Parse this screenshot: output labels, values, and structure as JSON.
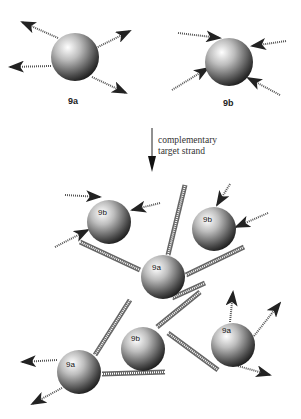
{
  "figure": {
    "top_particles": [
      {
        "id": "9a",
        "label": "9a",
        "cx": 75,
        "cy": 57,
        "r": 24
      },
      {
        "id": "9b",
        "label": "9b",
        "cx": 229,
        "cy": 62,
        "r": 24
      }
    ],
    "reaction_arrow": {
      "caption_line1": "complementary",
      "caption_line2": "target strand"
    },
    "aggregate_particles": [
      {
        "id": "9b-1",
        "label": "9b",
        "cx": 109,
        "cy": 222,
        "r": 22
      },
      {
        "id": "9b-2",
        "label": "9b",
        "cx": 214,
        "cy": 229,
        "r": 22
      },
      {
        "id": "9a-1",
        "label": "9a",
        "cx": 163,
        "cy": 277,
        "r": 22
      },
      {
        "id": "9b-3",
        "label": "9b",
        "cx": 143,
        "cy": 349,
        "r": 22
      },
      {
        "id": "9a-2",
        "label": "9a",
        "cx": 79,
        "cy": 372,
        "r": 22
      },
      {
        "id": "9a-3",
        "label": "9a",
        "cx": 233,
        "cy": 345,
        "r": 22
      }
    ]
  }
}
